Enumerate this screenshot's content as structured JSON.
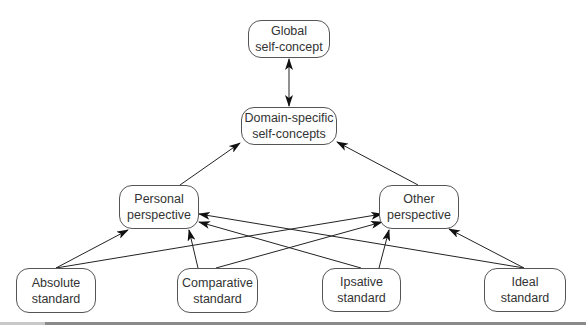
{
  "diagram": {
    "nodes": {
      "global": {
        "line1": "Global",
        "line2": "self-concept"
      },
      "domain": {
        "line1": "Domain-specific",
        "line2": "self-concepts"
      },
      "personal": {
        "line1": "Personal",
        "line2": "perspective"
      },
      "other": {
        "line1": "Other",
        "line2": "perspective"
      },
      "absolute": {
        "line1": "Absolute",
        "line2": "standard"
      },
      "comparative": {
        "line1": "Comparative",
        "line2": "standard"
      },
      "ipsative": {
        "line1": "Ipsative",
        "line2": "standard"
      },
      "ideal": {
        "line1": "Ideal",
        "line2": "standard"
      }
    },
    "edges": [
      {
        "from": "global",
        "to": "domain",
        "type": "bidirectional"
      },
      {
        "from": "personal",
        "to": "domain",
        "type": "directed"
      },
      {
        "from": "other",
        "to": "domain",
        "type": "directed"
      },
      {
        "from": "absolute",
        "to": "personal",
        "type": "directed"
      },
      {
        "from": "absolute",
        "to": "other",
        "type": "directed"
      },
      {
        "from": "comparative",
        "to": "personal",
        "type": "directed"
      },
      {
        "from": "comparative",
        "to": "other",
        "type": "directed"
      },
      {
        "from": "ipsative",
        "to": "personal",
        "type": "directed"
      },
      {
        "from": "ipsative",
        "to": "other",
        "type": "directed"
      },
      {
        "from": "ideal",
        "to": "personal",
        "type": "directed"
      },
      {
        "from": "ideal",
        "to": "other",
        "type": "directed"
      }
    ]
  }
}
